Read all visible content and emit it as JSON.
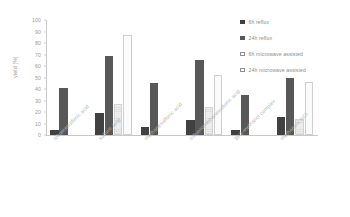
{
  "chart_data": {
    "type": "bar",
    "title": "",
    "xlabel": "",
    "ylabel": "yield [%]",
    "ylim": [
      0,
      100
    ],
    "ytick_step": 10,
    "yticks": [
      "100",
      "90",
      "80",
      "70",
      "60",
      "50",
      "40",
      "30",
      "20",
      "10",
      "0"
    ],
    "grid": false,
    "legend_position": "right",
    "categories": [
      "toluenesulfonic acid",
      "sulfuric acid",
      "methanesulfonic acid",
      "trifluoromethanesulfonic acid",
      "BF3-methanol complex",
      "methanolic HCl"
    ],
    "series": [
      {
        "name": "6h reflux",
        "color": "#414141",
        "values": [
          4,
          19,
          7,
          13,
          4,
          16
        ]
      },
      {
        "name": "24h reflux",
        "color": "#585858",
        "values": [
          41,
          69,
          45,
          65,
          35,
          50
        ]
      },
      {
        "name": "6h microwave assisted",
        "color": "#ededed",
        "values": [
          null,
          27,
          null,
          24,
          null,
          14
        ]
      },
      {
        "name": "24h microwave assisted",
        "color": "#fbfbfb",
        "values": [
          null,
          87,
          null,
          52,
          null,
          46
        ]
      }
    ]
  }
}
